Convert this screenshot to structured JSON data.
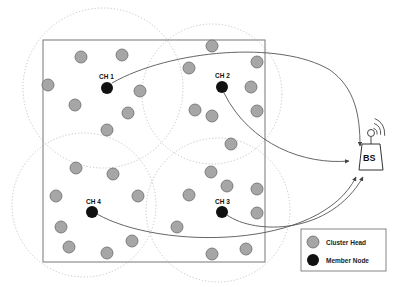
{
  "diagram": {
    "title": "",
    "colors": {
      "member": "#a6a6a6",
      "member_stroke": "#6b6b6b",
      "head": "#111111",
      "line": "#555555",
      "cluster_boundary": "#bdbdbd",
      "field_border": "#777777"
    },
    "cluster_heads": [
      {
        "id": "ch1",
        "label": "CH 1",
        "x": 107,
        "y": 88
      },
      {
        "id": "ch2",
        "label": "CH 2",
        "x": 222,
        "y": 87
      },
      {
        "id": "ch3",
        "label": "CH 3",
        "x": 222,
        "y": 212
      },
      {
        "id": "ch4",
        "label": "CH 4",
        "x": 92,
        "y": 212
      }
    ],
    "base_station": {
      "label": "BS",
      "x": 360,
      "y": 160
    },
    "legend": {
      "items": [
        {
          "label": "Cluster Head",
          "swatch": "gray"
        },
        {
          "label": "Member Node",
          "swatch": "black"
        }
      ]
    }
  }
}
